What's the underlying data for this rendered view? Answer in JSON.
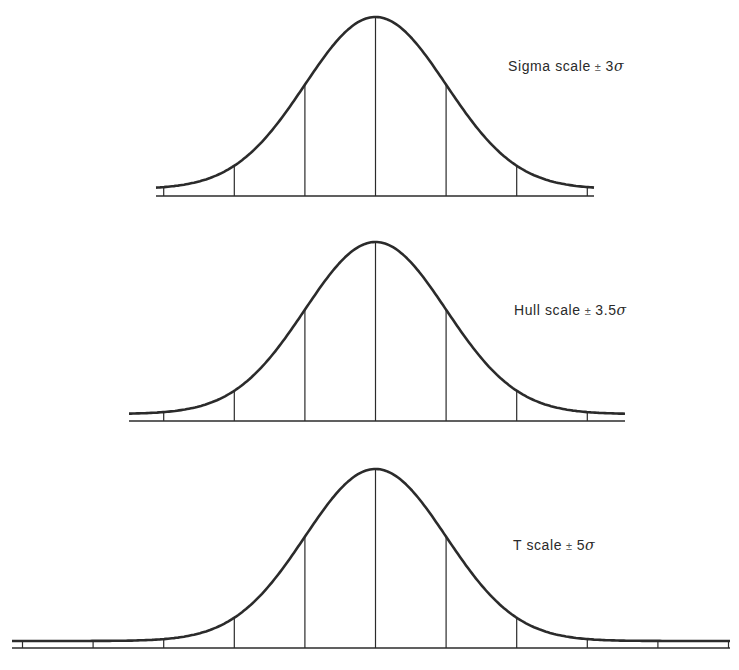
{
  "diagram": {
    "line_color": "#2b2b2b",
    "sigma_px": 70.6,
    "center_x": 375.5,
    "panels": [
      {
        "id": "sigma",
        "label_name": "Sigma scale",
        "label_pm": "±",
        "label_value": "3",
        "label_sigma": "σ",
        "range_sigma": 3,
        "baseline_y": 196,
        "peak_y": 17,
        "line_x_from": 156,
        "line_x_to": 594,
        "label_x": 508,
        "label_y": 58
      },
      {
        "id": "hull",
        "label_name": "Hull scale",
        "label_pm": "±",
        "label_value": "3.5",
        "label_sigma": "σ",
        "range_sigma": 3.5,
        "baseline_y": 421,
        "peak_y": 242,
        "line_x_from": 129,
        "line_x_to": 625,
        "label_x": 514,
        "label_y": 302
      },
      {
        "id": "t",
        "label_name": "T scale",
        "label_pm": "±",
        "label_value": "5",
        "label_sigma": "σ",
        "range_sigma": 5,
        "baseline_y": 648,
        "peak_y": 469,
        "line_x_from": 12,
        "line_x_to": 730,
        "label_x": 513,
        "label_y": 537
      }
    ]
  }
}
